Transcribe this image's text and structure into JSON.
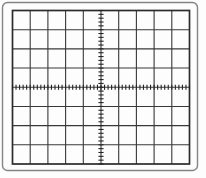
{
  "figure": {
    "canvas": {
      "width": 206,
      "height": 178,
      "background": "#fdfdfd"
    },
    "bezel": {
      "x": 2.5,
      "y": 2.5,
      "width": 195,
      "height": 168,
      "corner_radius": 5,
      "stroke": "#848484",
      "stroke_width": 1.4
    },
    "grid": {
      "left": 12.5,
      "top": 10.5,
      "right": 189.5,
      "bottom": 164,
      "columns": 10,
      "rows": 8,
      "border_color": "#2b2b2b",
      "border_width": 1.7,
      "line_color": "#383838",
      "line_width": 1.1
    },
    "axes": {
      "center_x": 101,
      "center_y": 87.25,
      "minor_ticks_per_division": 5,
      "tick_length": 5.2,
      "tick_width": 1.1,
      "color": "#242424"
    }
  }
}
